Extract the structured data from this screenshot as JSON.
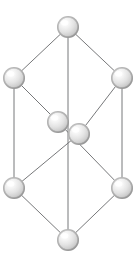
{
  "diagram": {
    "type": "3d-cube-graph",
    "canvas": {
      "width": 139,
      "height": 259,
      "background": "#ffffff"
    },
    "style": {
      "edge_color": "#77787a",
      "edge_width": 1,
      "node_fill_light": "#fdfdfd",
      "node_fill_mid": "#e2e2e2",
      "node_fill_dark": "#b4b4b4",
      "node_edge_shadow": "#a0a0a0"
    },
    "nodes": [
      {
        "id": "top",
        "label": "top vertex",
        "cx": 68,
        "cy": 27,
        "r": 11
      },
      {
        "id": "upper-left",
        "label": "upper left vertex",
        "cx": 14,
        "cy": 78,
        "r": 11
      },
      {
        "id": "upper-right",
        "label": "upper right vertex",
        "cx": 122,
        "cy": 78,
        "r": 11
      },
      {
        "id": "center-left",
        "label": "center left vertex",
        "cx": 58,
        "cy": 122,
        "r": 11
      },
      {
        "id": "center-right",
        "label": "center right vertex",
        "cx": 79,
        "cy": 134,
        "r": 11
      },
      {
        "id": "lower-left",
        "label": "lower left vertex",
        "cx": 14,
        "cy": 188,
        "r": 11
      },
      {
        "id": "lower-right",
        "label": "lower right vertex",
        "cx": 122,
        "cy": 188,
        "r": 11
      },
      {
        "id": "bottom",
        "label": "bottom vertex",
        "cx": 68,
        "cy": 240,
        "r": 11
      }
    ],
    "edges": [
      {
        "id": "e1",
        "from": "top",
        "to": "upper-left",
        "label": "top to upper left"
      },
      {
        "id": "e2",
        "from": "top",
        "to": "upper-right",
        "label": "top to upper right"
      },
      {
        "id": "e3",
        "from": "top",
        "to": "bottom",
        "label": "top to bottom vertical"
      },
      {
        "id": "e4",
        "from": "upper-left",
        "to": "center-left",
        "label": "upper left to center left"
      },
      {
        "id": "e5",
        "from": "upper-left",
        "to": "lower-left",
        "label": "upper left to lower left vertical"
      },
      {
        "id": "e6",
        "from": "upper-right",
        "to": "center-right",
        "label": "upper right to center right"
      },
      {
        "id": "e7",
        "from": "upper-right",
        "to": "lower-right",
        "label": "upper right to lower right vertical"
      },
      {
        "id": "e8",
        "from": "center-left",
        "to": "lower-right",
        "label": "center left to lower right"
      },
      {
        "id": "e9",
        "from": "center-right",
        "to": "lower-left",
        "label": "center right to lower left"
      },
      {
        "id": "e10",
        "from": "lower-left",
        "to": "bottom",
        "label": "lower left to bottom"
      },
      {
        "id": "e11",
        "from": "lower-right",
        "to": "bottom",
        "label": "lower right to bottom"
      }
    ]
  }
}
